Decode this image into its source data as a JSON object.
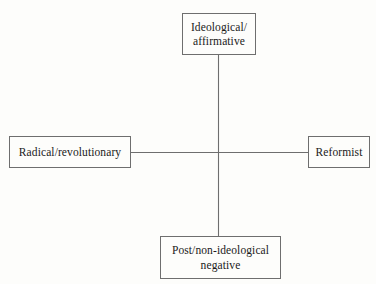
{
  "diagram": {
    "type": "two-axis-conceptual-matrix",
    "background_color": "#fdfdfb",
    "stroke_color": "#6e6e6e",
    "text_color": "#1a1a1a",
    "nodes": {
      "top": {
        "label": "Ideological/ affirmative",
        "line1": "Ideological/",
        "line2": "affirmative",
        "position": "top"
      },
      "left": {
        "label": "Radical/revolutionary",
        "line1": "Radical/revolutionary",
        "line2": "",
        "position": "left"
      },
      "right": {
        "label": "Reformist",
        "line1": "Reformist",
        "line2": "",
        "position": "right"
      },
      "bottom": {
        "label": "Post/non-ideological negative",
        "line1": "Post/non-ideological",
        "line2": "negative",
        "position": "bottom"
      }
    },
    "connectors": [
      {
        "name": "vertical-axis",
        "from": "top",
        "to": "bottom"
      },
      {
        "name": "horizontal-axis",
        "from": "left",
        "to": "right"
      }
    ]
  }
}
